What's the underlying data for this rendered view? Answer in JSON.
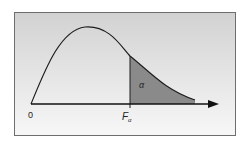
{
  "diagram": {
    "labels": {
      "origin": "0",
      "critical": "F",
      "critical_sub": "α",
      "area": "α"
    },
    "colors": {
      "frame_border": "#6e6e6e",
      "background_top": "#d4d4d4",
      "background_bottom": "#f6f6f6",
      "curve": "#1e1e1e",
      "shaded_area": "#8a8a8a",
      "axis": "#111111"
    }
  }
}
